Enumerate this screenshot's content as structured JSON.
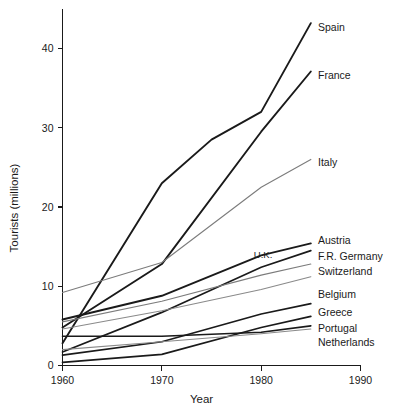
{
  "chart_data": {
    "type": "line",
    "title": "",
    "xlabel": "Year",
    "ylabel": "Tourists (millions)",
    "xlim": [
      1960,
      1990
    ],
    "ylim": [
      0,
      45
    ],
    "xticks": [
      1960,
      1970,
      1980,
      1990
    ],
    "yticks": [
      0,
      10,
      20,
      30,
      40
    ],
    "xtick_labels": [
      "1960",
      "1970",
      "1980",
      "1990"
    ],
    "ytick_labels": [
      "0",
      "10",
      "20",
      "30",
      "40"
    ],
    "grid": false,
    "legend_position": "right-inline-labels",
    "series": [
      {
        "name": "Spain",
        "label": "Spain",
        "color": "#1a1a1a",
        "width": 1.9,
        "label_mode": "right",
        "x": [
          1960,
          1970,
          1975,
          1980,
          1985
        ],
        "values": [
          2.8,
          23.0,
          28.5,
          32.0,
          43.2
        ]
      },
      {
        "name": "France",
        "label": "France",
        "color": "#1a1a1a",
        "width": 1.9,
        "label_mode": "right",
        "x": [
          1960,
          1970,
          1980,
          1985
        ],
        "values": [
          4.8,
          12.8,
          29.5,
          37.1
        ]
      },
      {
        "name": "Italy",
        "label": "Italy",
        "color": "#7c7c7c",
        "width": 1.1,
        "label_mode": "right",
        "x": [
          1960,
          1970,
          1980,
          1985
        ],
        "values": [
          9.2,
          13.0,
          22.5,
          26.0
        ]
      },
      {
        "name": "Austria",
        "label": "Austria",
        "color": "#1a1a1a",
        "width": 1.9,
        "label_mode": "right",
        "x": [
          1960,
          1970,
          1980,
          1985
        ],
        "values": [
          5.8,
          8.8,
          13.9,
          15.4
        ]
      },
      {
        "name": "U.K.",
        "label": "U.K.",
        "color": "#1a1a1a",
        "width": 1.7,
        "label_mode": "inline",
        "x": [
          1960,
          1970,
          1980,
          1985
        ],
        "values": [
          1.7,
          6.7,
          12.4,
          14.5
        ]
      },
      {
        "name": "F.R. Germany",
        "label": "F.R. Germany",
        "color": "#7c7c7c",
        "width": 1.1,
        "label_mode": "right",
        "x": [
          1960,
          1970,
          1980,
          1985
        ],
        "values": [
          5.5,
          8.1,
          11.4,
          12.8
        ]
      },
      {
        "name": "Switzerland",
        "label": "Switzerland",
        "color": "#8a8a8a",
        "width": 1.1,
        "label_mode": "right",
        "x": [
          1960,
          1970,
          1980,
          1985
        ],
        "values": [
          4.6,
          6.9,
          9.6,
          11.2
        ]
      },
      {
        "name": "Belgium",
        "label": "Belgium",
        "color": "#1a1a1a",
        "width": 1.7,
        "label_mode": "right",
        "x": [
          1960,
          1970,
          1980,
          1985
        ],
        "values": [
          1.3,
          3.0,
          6.5,
          7.8
        ]
      },
      {
        "name": "Greece",
        "label": "Greece",
        "color": "#1a1a1a",
        "width": 1.7,
        "label_mode": "right",
        "x": [
          1960,
          1970,
          1980,
          1985
        ],
        "values": [
          0.4,
          1.4,
          4.8,
          6.2
        ]
      },
      {
        "name": "Portugal",
        "label": "Portugal",
        "color": "#1a1a1a",
        "width": 1.6,
        "label_mode": "right",
        "x": [
          1960,
          1970,
          1980,
          1985
        ],
        "values": [
          3.7,
          3.7,
          4.2,
          5.0
        ]
      },
      {
        "name": "Netherlands",
        "label": "Netherlands",
        "color": "#8a8a8a",
        "width": 1.1,
        "label_mode": "right",
        "x": [
          1960,
          1970,
          1980,
          1985
        ],
        "values": [
          2.0,
          3.0,
          4.0,
          4.6
        ]
      }
    ]
  }
}
